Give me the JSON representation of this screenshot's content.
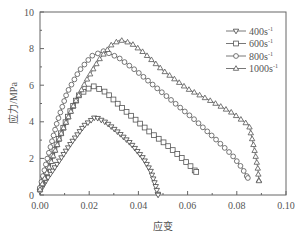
{
  "chart_data": {
    "type": "line",
    "title": "",
    "xlabel": "应变",
    "ylabel": "应力/MPa",
    "xlim": [
      0,
      0.1
    ],
    "ylim": [
      0,
      10
    ],
    "xticks": [
      "0.00",
      "0.02",
      "0.04",
      "0.06",
      "0.08",
      "0.10"
    ],
    "yticks": [
      "0",
      "2",
      "4",
      "6",
      "8",
      "10"
    ],
    "grid": false,
    "legend_position": "upper right",
    "series": [
      {
        "name": "400s⁻¹",
        "label_base": "400s",
        "marker": "triangle-down",
        "x": [
          0.0,
          0.003,
          0.008,
          0.013,
          0.018,
          0.0225,
          0.027,
          0.032,
          0.037,
          0.042,
          0.045,
          0.047,
          0.048
        ],
        "y": [
          0.2,
          0.9,
          1.9,
          2.9,
          3.8,
          4.26,
          3.95,
          3.4,
          2.8,
          2.0,
          1.3,
          0.5,
          0.0
        ]
      },
      {
        "name": "600s⁻¹",
        "label_base": "600s",
        "marker": "square",
        "x": [
          0.0,
          0.004,
          0.008,
          0.012,
          0.016,
          0.0215,
          0.027,
          0.033,
          0.039,
          0.045,
          0.051,
          0.057,
          0.061,
          0.0635
        ],
        "y": [
          0.3,
          1.8,
          3.2,
          4.5,
          5.5,
          5.96,
          5.6,
          4.8,
          4.1,
          3.4,
          2.8,
          2.1,
          1.6,
          1.26
        ]
      },
      {
        "name": "800s⁻¹",
        "label_base": "800s",
        "marker": "circle",
        "x": [
          0.0,
          0.003,
          0.007,
          0.011,
          0.016,
          0.021,
          0.026,
          0.032,
          0.039,
          0.047,
          0.055,
          0.063,
          0.071,
          0.078,
          0.082,
          0.0845
        ],
        "y": [
          0.4,
          2.0,
          4.0,
          5.6,
          6.8,
          7.6,
          7.87,
          7.5,
          6.8,
          5.9,
          5.0,
          4.1,
          3.1,
          2.2,
          1.5,
          0.93
        ]
      },
      {
        "name": "1000s⁻¹",
        "label_base": "1000s",
        "marker": "triangle-up",
        "x": [
          0.0,
          0.004,
          0.009,
          0.014,
          0.019,
          0.024,
          0.029,
          0.0325,
          0.037,
          0.042,
          0.05,
          0.06,
          0.07,
          0.078,
          0.083,
          0.085,
          0.087,
          0.0885,
          0.089
        ],
        "y": [
          0.3,
          1.6,
          3.5,
          5.0,
          6.3,
          7.4,
          8.2,
          8.47,
          8.3,
          7.8,
          6.8,
          5.8,
          5.1,
          4.5,
          4.0,
          3.8,
          2.6,
          1.5,
          0.77
        ]
      }
    ]
  },
  "legend": {
    "items": [
      {
        "label": "400s",
        "sup": "-1"
      },
      {
        "label": "600s",
        "sup": "-1"
      },
      {
        "label": "800s",
        "sup": "-1"
      },
      {
        "label": "1000s",
        "sup": "-1"
      }
    ]
  }
}
